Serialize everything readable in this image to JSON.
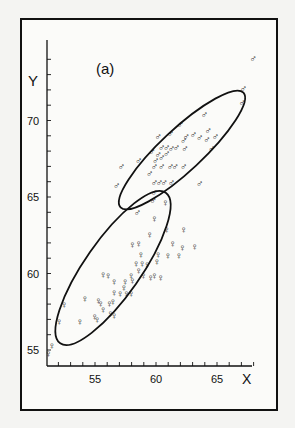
{
  "chart_data": {
    "type": "scatter",
    "title": "(a)",
    "xlabel": "X",
    "ylabel": "Y",
    "xlim": [
      51.2,
      68.5
    ],
    "ylim": [
      54.5,
      74.5
    ],
    "x_ticks": [
      55,
      60,
      65
    ],
    "y_ticks": [
      55,
      60,
      65,
      70
    ],
    "grid": false,
    "legend": "none (symbols: male ♂, female ♀)",
    "series": [
      {
        "name": "male",
        "symbol": "♂",
        "points": [
          [
            68.0,
            74.1
          ],
          [
            67.2,
            72.1
          ],
          [
            67.1,
            71.2
          ],
          [
            64.0,
            70.4
          ],
          [
            62.0,
            69.8
          ],
          [
            64.3,
            69.4
          ],
          [
            62.5,
            69.0
          ],
          [
            63.1,
            69.1
          ],
          [
            63.6,
            68.9
          ],
          [
            64.2,
            68.8
          ],
          [
            64.9,
            69.0
          ],
          [
            61.2,
            69.2
          ],
          [
            62.3,
            68.7
          ],
          [
            60.2,
            69.0
          ],
          [
            60.5,
            68.3
          ],
          [
            60.9,
            68.3
          ],
          [
            61.3,
            68.2
          ],
          [
            61.7,
            68.3
          ],
          [
            59.7,
            68.0
          ],
          [
            60.2,
            67.8
          ],
          [
            60.5,
            67.6
          ],
          [
            60.0,
            67.4
          ],
          [
            64.6,
            68.2
          ],
          [
            58.6,
            67.4
          ],
          [
            62.4,
            68.2
          ],
          [
            60.9,
            67.9
          ],
          [
            59.9,
            67.0
          ],
          [
            60.5,
            67.0
          ],
          [
            61.2,
            67.0
          ],
          [
            61.6,
            67.0
          ],
          [
            62.3,
            67.0
          ],
          [
            59.5,
            66.6
          ],
          [
            59.9,
            66.0
          ],
          [
            60.3,
            66.0
          ],
          [
            60.7,
            66.0
          ],
          [
            61.3,
            66.0
          ],
          [
            63.6,
            65.9
          ],
          [
            59.9,
            65.3
          ],
          [
            59.8,
            64.8
          ],
          [
            58.5,
            64.0
          ],
          [
            57.2,
            67.0
          ],
          [
            56.8,
            65.8
          ]
        ]
      },
      {
        "name": "female",
        "symbol": "♀",
        "points": [
          [
            60.8,
            64.7
          ],
          [
            59.9,
            63.6
          ],
          [
            59.5,
            62.6
          ],
          [
            60.9,
            62.9
          ],
          [
            62.3,
            62.9
          ],
          [
            61.4,
            62.0
          ],
          [
            58.1,
            61.9
          ],
          [
            58.8,
            61.3
          ],
          [
            58.9,
            60.7
          ],
          [
            59.3,
            60.6
          ],
          [
            60.1,
            60.8
          ],
          [
            60.2,
            61.3
          ],
          [
            61.0,
            61.2
          ],
          [
            61.9,
            61.2
          ],
          [
            62.2,
            61.7
          ],
          [
            63.2,
            61.8
          ],
          [
            58.6,
            62.0
          ],
          [
            58.4,
            60.7
          ],
          [
            58.6,
            60.2
          ],
          [
            59.0,
            59.9
          ],
          [
            59.6,
            59.8
          ],
          [
            59.9,
            59.9
          ],
          [
            58.0,
            59.9
          ],
          [
            60.4,
            59.8
          ],
          [
            55.7,
            60.0
          ],
          [
            56.1,
            59.9
          ],
          [
            56.6,
            59.5
          ],
          [
            57.5,
            59.5
          ],
          [
            58.1,
            59.6
          ],
          [
            57.4,
            59.1
          ],
          [
            56.6,
            58.8
          ],
          [
            57.1,
            58.7
          ],
          [
            57.6,
            58.7
          ],
          [
            58.0,
            58.7
          ],
          [
            56.2,
            58.1
          ],
          [
            56.5,
            58.2
          ],
          [
            55.3,
            58.3
          ],
          [
            55.5,
            58.1
          ],
          [
            55.0,
            57.2
          ],
          [
            55.7,
            57.7
          ],
          [
            56.3,
            57.4
          ],
          [
            56.6,
            57.3
          ],
          [
            54.2,
            58.4
          ],
          [
            52.5,
            58.0
          ],
          [
            52.1,
            56.9
          ],
          [
            53.8,
            56.9
          ],
          [
            55.2,
            57.0
          ],
          [
            51.5,
            55.3
          ],
          [
            51.2,
            54.8
          ]
        ]
      }
    ],
    "ellipses": [
      {
        "name": "male-ellipse",
        "center": [
          62.0,
          68.8
        ],
        "note": "tilted ellipse enclosing most male points"
      },
      {
        "name": "female-ellipse",
        "center": [
          56.3,
          60.0
        ],
        "note": "tilted ellipse enclosing most female points"
      }
    ]
  }
}
